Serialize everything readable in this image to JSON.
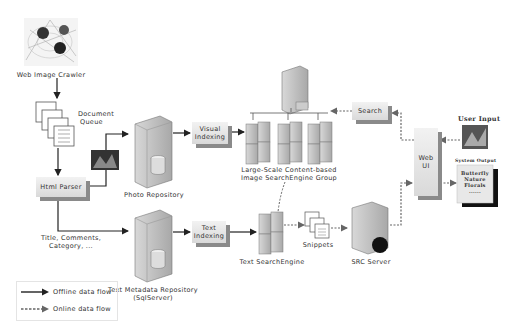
{
  "nodes": {
    "crawler": "Web Image Crawler",
    "doc_queue_line1": "Document",
    "doc_queue_line2": "Queue",
    "html_parser": "Html Parser",
    "photo_repo": "Photo Repository",
    "visual_indexing_line1": "Visual",
    "visual_indexing_line2": "Indexing",
    "cbir_line1": "Large-Scale Content-based",
    "cbir_line2": "Image SearchEngine Group",
    "search": "Search",
    "text_meta_line1": "Text Metadata Repository",
    "text_meta_line2": "(SqlServer)",
    "text_indexing_line1": "Text",
    "text_indexing_line2": "Indexing",
    "text_search": "Text SearchEngine",
    "snippets": "Snippets",
    "src_server": "SRC Server",
    "web_ui_line1": "Web",
    "web_ui_line2": "UI",
    "user_input": "User Input",
    "system_output": "System Output",
    "output_line1": "Butterfly",
    "output_line2": "Nature",
    "output_line3": "Florals",
    "output_line4": "......",
    "meta_fields_line1": "Title, Comments,",
    "meta_fields_line2": "Category, ..."
  },
  "legend": {
    "offline": "Offline data flow",
    "online": "Online data flow"
  },
  "colors": {
    "offline_line": "#222222",
    "online_line": "#666666",
    "box_shadow": "#8a8a8a"
  }
}
